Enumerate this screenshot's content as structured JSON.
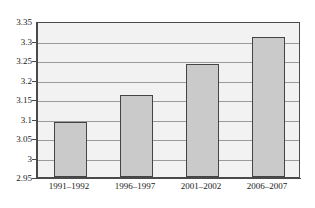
{
  "chart_data": {
    "type": "bar",
    "title": "",
    "subtitle": "",
    "xlabel": "",
    "ylabel": "",
    "categories": [
      "1991–1992",
      "1996–1997",
      "2001–2002",
      "2006–2007"
    ],
    "values": [
      3.09,
      3.16,
      3.24,
      3.31
    ],
    "ylim": [
      2.95,
      3.35
    ],
    "ytick_step": 0.05,
    "yticks": [
      "2.95",
      "3",
      "3.05",
      "3.1",
      "3.15",
      "3.2",
      "3.25",
      "3.3",
      "3.35"
    ],
    "ytick_values": [
      2.95,
      3.0,
      3.05,
      3.1,
      3.15,
      3.2,
      3.25,
      3.3,
      3.35
    ],
    "grid": true,
    "grid_axis": "y",
    "legend": false,
    "legend_position": "none",
    "series": [
      {
        "name": "",
        "values": [
          3.09,
          3.16,
          3.24,
          3.31
        ]
      }
    ],
    "colors": {
      "bar_fill": "#cacaca",
      "bar_border": "#444444",
      "plot_background": "#f2f2f2",
      "plot_border": "#4a4a4a",
      "gridline": "#9a9a9a",
      "text": "#1a1a1a",
      "page_background": "#ffffff"
    }
  }
}
